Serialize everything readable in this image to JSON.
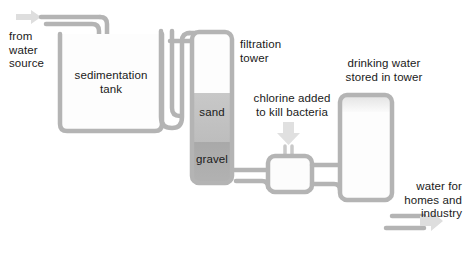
{
  "diagram": {
    "colors": {
      "pipe": "#b0b0b0",
      "pipe_light": "#c9c9c9",
      "tank_outline": "#b4b4b4",
      "tank_fill": "#fcfcfc",
      "sand_fill": "#c2c2c2",
      "gravel_fill": "#a6a6a6",
      "arrow": "#d8d8d8",
      "text": "#1a1a1a"
    },
    "labels": {
      "source": "from\nwater\nsource",
      "sedimentation_tank": "sedimentation\ntank",
      "filtration_tower": "filtration\ntower",
      "sand": "sand",
      "gravel": "gravel",
      "chlorine": "chlorine added\nto kill bacteria",
      "storage_tower": "drinking water\nstored in tower",
      "output": "water for\nhomes and\nindustry"
    },
    "stages": [
      {
        "name": "water-source-inlet",
        "label": "from water source"
      },
      {
        "name": "sedimentation-tank",
        "label": "sedimentation tank"
      },
      {
        "name": "filtration-tower",
        "label": "filtration tower",
        "layers": [
          "sand",
          "gravel"
        ]
      },
      {
        "name": "chlorination-chamber",
        "label": "chlorine added to kill bacteria"
      },
      {
        "name": "storage-tower",
        "label": "drinking water stored in tower"
      },
      {
        "name": "distribution-outlet",
        "label": "water for homes and industry"
      }
    ]
  }
}
